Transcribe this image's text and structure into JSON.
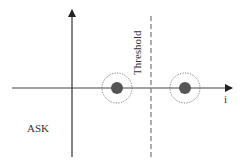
{
  "diagram": {
    "type": "ASK constellation / decision threshold diagram",
    "labels": {
      "threshold": "Threshold",
      "modulation": "ASK",
      "axis_x": "i"
    },
    "axes": {
      "origin": [
        72,
        88
      ],
      "horizontal_axis": {
        "from": [
          12,
          88
        ],
        "to": [
          232,
          88
        ],
        "arrow": "right"
      },
      "vertical_axis": {
        "from": [
          72,
          157
        ],
        "to": [
          72,
          10
        ],
        "arrow": "up"
      }
    },
    "threshold_line": {
      "x": 151,
      "y_from": 16,
      "y_to": 157,
      "style": "dashed"
    },
    "symbols": [
      {
        "name": "symbol-0",
        "center": [
          117,
          88
        ],
        "dot_radius": 6,
        "noise_radius": 15
      },
      {
        "name": "symbol-1",
        "center": [
          185,
          88
        ],
        "dot_radius": 6,
        "noise_radius": 15
      }
    ],
    "colors": {
      "axis": "#333333",
      "dot": "#555555",
      "noise_ring": "#666666",
      "threshold": "#777777"
    }
  }
}
